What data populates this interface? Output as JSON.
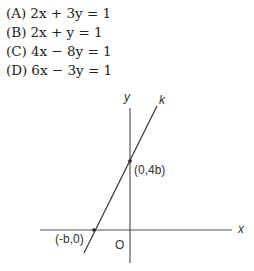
{
  "choices": [
    {
      "label": "(A)",
      "equation": "2x + 3y = 1"
    },
    {
      "label": "(B)",
      "equation": "2x + y = 1"
    },
    {
      "label": "(C)",
      "equation": "4x − 8y = 1"
    },
    {
      "label": "(D)",
      "equation": "6x − 3y = 1"
    }
  ],
  "diagram": {
    "x_axis_label": "x",
    "y_axis_label": "y",
    "origin_label": "O",
    "line_label": "k",
    "y_intercept_label": "(0,4b)",
    "x_intercept_label": "(-b,0)",
    "line_color": "#333333",
    "axis_color": "#555555"
  }
}
